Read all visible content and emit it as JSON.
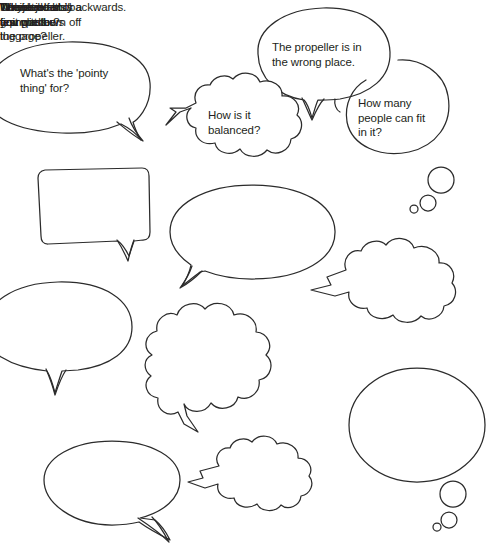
{
  "page": {
    "background_color": "#ffffff",
    "stroke_color": "#2b2b2b",
    "text_color": "#231f20",
    "width": 498,
    "height": 558
  },
  "bubbles": [
    {
      "id": "pointy-thing",
      "text": "What's the 'pointy\nthing' for?",
      "shape": "speech-oval",
      "tail": "bottom-right",
      "clipped_edge": "left"
    },
    {
      "id": "propeller-wrong-place",
      "text": "The propeller is in\nthe wrong place.",
      "shape": "speech-oval",
      "tail": "bottom-center",
      "clipped_edge": "none"
    },
    {
      "id": "how-is-it-balanced",
      "text": "How is it\nbalanced?",
      "shape": "thought-cloud",
      "tail": "left",
      "clipped_edge": "none"
    },
    {
      "id": "how-many-people",
      "text": "How many\npeople can fit\nin it?",
      "shape": "thought-oval",
      "tail": "bottom-right-dots",
      "clipped_edge": "none"
    },
    {
      "id": "its-backwards",
      "text": "It's backwards.",
      "shape": "speech-rectangle",
      "tail": "bottom-right",
      "clipped_edge": "none"
    },
    {
      "id": "jet-blast-burn",
      "text": "The jet blast is\ngoing to burn off\nthe propeller.",
      "shape": "speech-oval",
      "tail": "bottom-left",
      "clipped_edge": "none"
    },
    {
      "id": "unbalanced",
      "text": "Unbalanced.",
      "shape": "thought-cloud",
      "tail": "left-point",
      "clipped_edge": "none"
    },
    {
      "id": "few-windows",
      "text": "There are only a\nfew windows",
      "shape": "speech-oval",
      "tail": "bottom-center",
      "clipped_edge": "left"
    },
    {
      "id": "why-jet-and-propeller",
      "text_html": "Why a jet <em>and</em>\na propeller?",
      "text": "Why a jet and\na propeller?",
      "shape": "thought-cloud",
      "tail": "bottom-center",
      "clipped_edge": "none"
    },
    {
      "id": "where-luggage",
      "text": "Where do\nyou put the\nluggage?",
      "shape": "thought-oval",
      "tail": "bottom-right-dots",
      "clipped_edge": "none"
    },
    {
      "id": "no-room-first-class",
      "text": "No room for\nfirst class.",
      "shape": "speech-oval",
      "tail": "bottom-right",
      "clipped_edge": "none"
    },
    {
      "id": "terrible",
      "text": "Terrible.",
      "shape": "thought-cloud",
      "tail": "left-point",
      "clipped_edge": "none"
    }
  ]
}
